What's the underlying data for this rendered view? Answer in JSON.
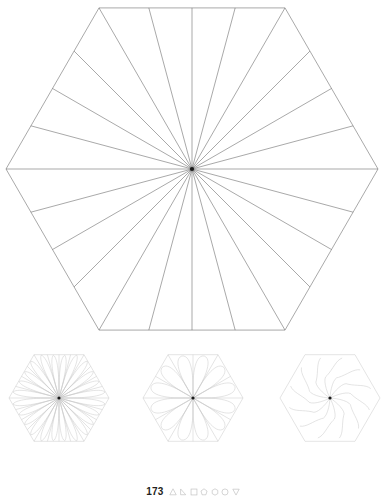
{
  "page": {
    "number": "173",
    "background_color": "#ffffff",
    "width": 386,
    "height": 502
  },
  "style": {
    "main_stroke_color": "#6e6e6e",
    "main_stroke_width": 0.6,
    "small_stroke_color": "#c9c9c9",
    "small_stroke_width": 0.5,
    "center_dot_color": "#1a1a1a",
    "footer_icon_color": "#bdbdbd",
    "page_number_color": "#231f20"
  },
  "figures": {
    "main": {
      "name": "hexagon-24-ray-division",
      "shape": "hexagon",
      "orientation": "flat-left-right-vertices",
      "center": {
        "x": 192,
        "y": 169
      },
      "circumradius": 186,
      "vertices": [
        {
          "x": 378,
          "y": 169
        },
        {
          "x": 285,
          "y": 3
        },
        {
          "x": 99,
          "y": 3
        },
        {
          "x": 6,
          "y": 169
        },
        {
          "x": 99,
          "y": 336
        },
        {
          "x": 285,
          "y": 336
        }
      ],
      "ray_count": 24,
      "ray_spacing_degrees": 15,
      "has_center_dot": true
    },
    "small": [
      {
        "name": "hexagon-24-petal-narrow",
        "label_index": 1,
        "center": {
          "x": 59,
          "y": 398
        },
        "circumradius": 52,
        "petal_count": 24,
        "petal_style": "narrow-outward-lobe",
        "has_radial_lines": true,
        "has_center_dot": true
      },
      {
        "name": "hexagon-12-petal-wide",
        "label_index": 2,
        "center": {
          "x": 193,
          "y": 398
        },
        "circumradius": 52,
        "petal_count": 12,
        "petal_style": "wide-outward-lobe",
        "has_radial_lines": true,
        "has_center_dot": true
      },
      {
        "name": "hexagon-12-petal-pinwheel",
        "label_index": 3,
        "center": {
          "x": 330,
          "y": 398
        },
        "circumradius": 52,
        "petal_count": 12,
        "petal_style": "swirled-s-curve-pinwheel",
        "has_radial_lines": false,
        "has_center_dot": true
      }
    ]
  },
  "footer": {
    "page_number": "173",
    "icons": [
      {
        "name": "triangle-icon",
        "glyph": "triangle"
      },
      {
        "name": "scalene-triangle-icon",
        "glyph": "scalene-triangle"
      },
      {
        "name": "square-icon",
        "glyph": "square"
      },
      {
        "name": "pentagon-icon",
        "glyph": "pentagon"
      },
      {
        "name": "hexagon-icon",
        "glyph": "hexagon"
      },
      {
        "name": "circle-icon",
        "glyph": "circle"
      },
      {
        "name": "inverted-triangle-icon",
        "glyph": "inverted-triangle"
      }
    ]
  }
}
